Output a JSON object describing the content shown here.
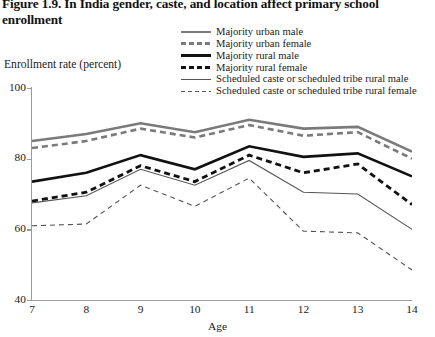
{
  "figure": {
    "title": "Figure 1.9. In India gender, caste, and location affect primary school enrollment"
  },
  "axes": {
    "ylabel": "Enrollment rate (percent)",
    "xlabel": "Age",
    "yticks": [
      "40",
      "60",
      "80",
      "100"
    ],
    "xticks": [
      "7",
      "8",
      "9",
      "10",
      "11",
      "12",
      "13",
      "14"
    ]
  },
  "colors": {
    "gray": "#7a7a7a",
    "black": "#111111",
    "axis": "#9a9a9a",
    "background": "#ffffff"
  },
  "legend": {
    "items": [
      {
        "label": "Majority urban male"
      },
      {
        "label": "Majority urban female"
      },
      {
        "label": "Majority rural male"
      },
      {
        "label": "Majority rural female"
      },
      {
        "label": "Scheduled caste or scheduled tribe rural male"
      },
      {
        "label": "Scheduled caste or scheduled tribe rural female"
      }
    ]
  },
  "chart_data": {
    "type": "line",
    "title": "Figure 1.9. In India gender, caste, and location affect primary school enrollment",
    "xlabel": "Age",
    "ylabel": "Enrollment rate (percent)",
    "x": [
      7,
      8,
      9,
      10,
      11,
      12,
      13,
      14
    ],
    "xlim": [
      7,
      14
    ],
    "ylim": [
      40,
      100
    ],
    "yticks": [
      40,
      60,
      80,
      100
    ],
    "grid": false,
    "legend_position": "top-right",
    "series": [
      {
        "name": "Majority urban male",
        "color": "#7a7a7a",
        "style": "solid",
        "width": 2.6,
        "values": [
          85,
          87,
          90,
          87.5,
          91,
          88.5,
          89,
          82
        ]
      },
      {
        "name": "Majority urban female",
        "color": "#7a7a7a",
        "style": "dashed",
        "width": 2.6,
        "values": [
          83,
          85,
          88.5,
          86,
          89.5,
          86.5,
          87.5,
          80
        ]
      },
      {
        "name": "Majority rural male",
        "color": "#111111",
        "style": "solid",
        "width": 2.6,
        "values": [
          73.5,
          76,
          81,
          77,
          83.5,
          80.5,
          81.5,
          75
        ]
      },
      {
        "name": "Majority rural female",
        "color": "#111111",
        "style": "dashed",
        "width": 2.8,
        "values": [
          68,
          70.5,
          78,
          73.5,
          81,
          76,
          78.5,
          67
        ]
      },
      {
        "name": "Scheduled caste or scheduled tribe rural male",
        "color": "#555555",
        "style": "solid",
        "width": 1.1,
        "values": [
          67.5,
          69.5,
          77,
          72.5,
          79.5,
          70.5,
          70,
          60
        ]
      },
      {
        "name": "Scheduled caste or scheduled tribe rural female",
        "color": "#555555",
        "style": "dashed",
        "width": 1.1,
        "values": [
          61,
          61.5,
          72.5,
          66.5,
          74.5,
          59.5,
          59,
          48.5
        ]
      }
    ]
  }
}
